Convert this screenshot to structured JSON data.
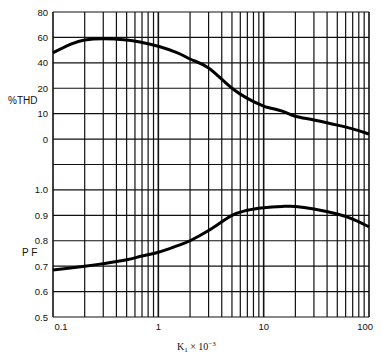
{
  "chart_data": [
    {
      "type": "line",
      "title": "",
      "xlabel": "K1 × 10^-3",
      "ylabel": "%THD",
      "x_scale": "log",
      "xlim": [
        0.1,
        100
      ],
      "y_tick_labels": [
        "80",
        "60",
        "40",
        "20",
        "10",
        "0"
      ],
      "grid": true,
      "series": [
        {
          "name": "%THD",
          "x": [
            0.1,
            0.15,
            0.2,
            0.3,
            0.5,
            0.7,
            1,
            1.5,
            2,
            3,
            5,
            7,
            10,
            15,
            20,
            30,
            50,
            70,
            100
          ],
          "values": [
            48,
            55,
            58,
            59,
            58,
            56,
            53,
            48,
            43,
            36,
            20,
            16,
            13,
            11,
            9,
            7.5,
            5.5,
            4,
            2
          ]
        }
      ]
    },
    {
      "type": "line",
      "title": "",
      "xlabel": "K1 × 10^-3",
      "ylabel": "PF",
      "x_scale": "log",
      "xlim": [
        0.1,
        100
      ],
      "ylim": [
        0.5,
        1.0
      ],
      "y_tick_labels": [
        "1.0",
        "0.9",
        "0.8",
        "0.7",
        "0.6",
        "0.5"
      ],
      "grid": true,
      "series": [
        {
          "name": "PF",
          "x": [
            0.1,
            0.2,
            0.3,
            0.5,
            0.7,
            1,
            1.5,
            2,
            3,
            5,
            7,
            10,
            15,
            20,
            30,
            50,
            70,
            100
          ],
          "values": [
            0.685,
            0.7,
            0.71,
            0.725,
            0.74,
            0.755,
            0.78,
            0.8,
            0.84,
            0.9,
            0.92,
            0.93,
            0.935,
            0.935,
            0.925,
            0.905,
            0.885,
            0.855
          ]
        }
      ]
    }
  ],
  "axes": {
    "x_ticks": [
      {
        "value": 0.1,
        "label": "0.1"
      },
      {
        "value": 1,
        "label": "1"
      },
      {
        "value": 10,
        "label": "10"
      },
      {
        "value": 100,
        "label": "100"
      }
    ],
    "x_label_main": "K",
    "x_label_sub": "1",
    "x_label_times": " × 10",
    "x_label_sup": "−3",
    "thd_label": "%THD",
    "pf_label": "P F",
    "thd_ticks": [
      "80",
      "60",
      "40",
      "20",
      "10",
      "0"
    ],
    "pf_ticks": [
      "1.0",
      "0.9",
      "0.8",
      "0.7",
      "0.6",
      "0.5"
    ]
  }
}
